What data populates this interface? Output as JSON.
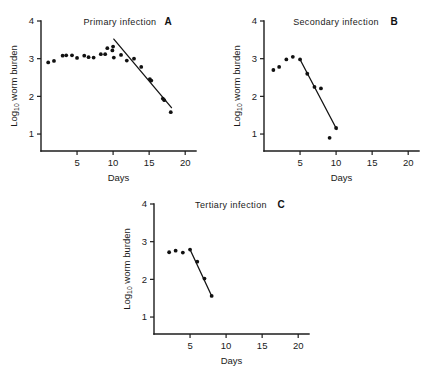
{
  "figure": {
    "axis_titles": {
      "x": "Days",
      "y_main": "Log",
      "y_sub": "10",
      "y_rest": " worm burden"
    },
    "x_ticks": [
      "5",
      "10",
      "15",
      "20"
    ],
    "y_ticks": [
      "1",
      "2",
      "3",
      "4"
    ]
  },
  "chart_data": [
    {
      "type": "scatter",
      "panel": "A",
      "title": "Primary infection",
      "xlabel": "Days",
      "ylabel": "Log10 worm burden",
      "xlim": [
        0,
        21.5
      ],
      "ylim": [
        0.55,
        4.0
      ],
      "xticks": [
        5,
        10,
        15,
        20
      ],
      "yticks": [
        1,
        2,
        3,
        4
      ],
      "grid": false,
      "legend": "none",
      "points": [
        {
          "x": 1.0,
          "y": 2.9
        },
        {
          "x": 1.8,
          "y": 2.94
        },
        {
          "x": 3.0,
          "y": 3.08
        },
        {
          "x": 3.5,
          "y": 3.09
        },
        {
          "x": 4.3,
          "y": 3.09
        },
        {
          "x": 5.0,
          "y": 3.02
        },
        {
          "x": 6.0,
          "y": 3.08
        },
        {
          "x": 6.6,
          "y": 3.04
        },
        {
          "x": 7.3,
          "y": 3.03
        },
        {
          "x": 8.3,
          "y": 3.12
        },
        {
          "x": 8.9,
          "y": 3.12
        },
        {
          "x": 9.2,
          "y": 3.28
        },
        {
          "x": 9.9,
          "y": 3.22
        },
        {
          "x": 10.0,
          "y": 3.32
        },
        {
          "x": 10.1,
          "y": 3.03
        },
        {
          "x": 11.1,
          "y": 3.1
        },
        {
          "x": 11.9,
          "y": 2.95
        },
        {
          "x": 12.9,
          "y": 3.0
        },
        {
          "x": 13.9,
          "y": 2.78
        },
        {
          "x": 15.1,
          "y": 2.46
        },
        {
          "x": 15.3,
          "y": 2.42
        },
        {
          "x": 16.9,
          "y": 1.94
        },
        {
          "x": 17.1,
          "y": 1.9
        },
        {
          "x": 18.0,
          "y": 1.58
        }
      ],
      "fit_line": {
        "x1": 10.1,
        "y1": 3.52,
        "x2": 18.1,
        "y2": 1.7
      }
    },
    {
      "type": "scatter",
      "panel": "B",
      "title": "Secondary infection",
      "xlabel": "Days",
      "ylabel": "Log10 worm burden",
      "xlim": [
        0,
        21.5
      ],
      "ylim": [
        0.55,
        4.0
      ],
      "xticks": [
        5,
        10,
        15,
        20
      ],
      "yticks": [
        1,
        2,
        3,
        4
      ],
      "grid": false,
      "legend": "none",
      "points": [
        {
          "x": 1.3,
          "y": 2.7
        },
        {
          "x": 2.1,
          "y": 2.78
        },
        {
          "x": 3.1,
          "y": 2.98
        },
        {
          "x": 4.0,
          "y": 3.05
        },
        {
          "x": 5.0,
          "y": 2.98
        },
        {
          "x": 6.0,
          "y": 2.6
        },
        {
          "x": 7.0,
          "y": 2.25
        },
        {
          "x": 7.9,
          "y": 2.21
        },
        {
          "x": 9.1,
          "y": 0.9
        },
        {
          "x": 10.0,
          "y": 1.16
        }
      ],
      "fit_line": {
        "x1": 5.0,
        "y1": 2.98,
        "x2": 10.1,
        "y2": 1.12
      }
    },
    {
      "type": "scatter",
      "panel": "C",
      "title": "Tertiary infection",
      "xlabel": "Days",
      "ylabel": "Log10 worm burden",
      "xlim": [
        0,
        21.5
      ],
      "ylim": [
        0.55,
        4.0
      ],
      "xticks": [
        5,
        10,
        15,
        20
      ],
      "yticks": [
        1,
        2,
        3,
        4
      ],
      "grid": false,
      "legend": "none",
      "points": [
        {
          "x": 2.1,
          "y": 2.72
        },
        {
          "x": 3.0,
          "y": 2.76
        },
        {
          "x": 4.0,
          "y": 2.71
        },
        {
          "x": 5.0,
          "y": 2.79
        },
        {
          "x": 6.0,
          "y": 2.47
        },
        {
          "x": 7.0,
          "y": 2.02
        },
        {
          "x": 8.0,
          "y": 1.56
        }
      ],
      "fit_line": {
        "x1": 5.0,
        "y1": 2.79,
        "x2": 8.0,
        "y2": 1.56
      }
    }
  ]
}
